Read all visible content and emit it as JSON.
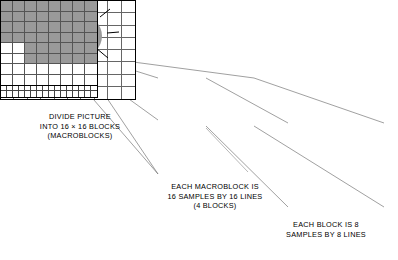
{
  "diagram": {
    "colors": {
      "shaded": "#9a9a9a",
      "black": "#000000",
      "white": "#ffffff",
      "grid_line": "#555555",
      "outline": "#000000"
    },
    "panels": {
      "picture": {
        "name": "picture",
        "grid_cols": 10,
        "grid_rows": 8,
        "sun_label": "sun",
        "selected_block_label": "macroblock"
      },
      "macroblock": {
        "name": "macroblock",
        "grid_cols": 16,
        "grid_rows": 16,
        "highlight_block_label": "block",
        "shaded_cells": [
          [
            0,
            0
          ],
          [
            0,
            1
          ],
          [
            0,
            2
          ],
          [
            0,
            3
          ],
          [
            0,
            4
          ],
          [
            0,
            5
          ],
          [
            0,
            6
          ],
          [
            0,
            7
          ],
          [
            0,
            8
          ],
          [
            0,
            9
          ],
          [
            0,
            10
          ],
          [
            0,
            11
          ],
          [
            0,
            12
          ],
          [
            0,
            13
          ],
          [
            0,
            14
          ],
          [
            0,
            15
          ],
          [
            1,
            0
          ],
          [
            1,
            1
          ],
          [
            1,
            2
          ],
          [
            1,
            3
          ],
          [
            1,
            4
          ],
          [
            1,
            5
          ],
          [
            1,
            6
          ],
          [
            1,
            7
          ],
          [
            1,
            8
          ],
          [
            1,
            9
          ],
          [
            1,
            10
          ],
          [
            1,
            11
          ],
          [
            1,
            12
          ],
          [
            1,
            13
          ],
          [
            1,
            14
          ],
          [
            1,
            15
          ],
          [
            2,
            0
          ],
          [
            2,
            1
          ],
          [
            2,
            2
          ],
          [
            2,
            3
          ],
          [
            2,
            4
          ],
          [
            2,
            5
          ],
          [
            2,
            6
          ],
          [
            2,
            7
          ],
          [
            2,
            8
          ],
          [
            2,
            9
          ],
          [
            2,
            10
          ],
          [
            2,
            11
          ],
          [
            2,
            12
          ],
          [
            2,
            13
          ],
          [
            2,
            14
          ],
          [
            2,
            15
          ],
          [
            3,
            5
          ],
          [
            3,
            6
          ],
          [
            3,
            7
          ],
          [
            3,
            8
          ],
          [
            3,
            9
          ],
          [
            3,
            10
          ],
          [
            3,
            11
          ],
          [
            3,
            12
          ],
          [
            3,
            13
          ],
          [
            3,
            14
          ],
          [
            3,
            15
          ],
          [
            4,
            5
          ],
          [
            4,
            6
          ],
          [
            4,
            7
          ],
          [
            4,
            8
          ],
          [
            4,
            9
          ],
          [
            4,
            10
          ],
          [
            4,
            11
          ],
          [
            4,
            12
          ],
          [
            4,
            13
          ],
          [
            4,
            14
          ],
          [
            4,
            15
          ],
          [
            5,
            8
          ],
          [
            5,
            9
          ],
          [
            5,
            10
          ],
          [
            5,
            11
          ],
          [
            5,
            12
          ],
          [
            5,
            13
          ],
          [
            5,
            14
          ],
          [
            5,
            15
          ],
          [
            6,
            8
          ],
          [
            6,
            9
          ],
          [
            6,
            10
          ],
          [
            6,
            11
          ],
          [
            6,
            12
          ],
          [
            6,
            13
          ],
          [
            6,
            14
          ],
          [
            6,
            15
          ],
          [
            7,
            8
          ],
          [
            7,
            9
          ],
          [
            7,
            10
          ],
          [
            7,
            11
          ],
          [
            7,
            12
          ],
          [
            7,
            13
          ],
          [
            7,
            14
          ],
          [
            7,
            15
          ]
        ],
        "black_cells": [
          [
            12,
            8
          ],
          [
            13,
            6
          ]
        ]
      },
      "block": {
        "name": "block",
        "grid_cols": 8,
        "grid_rows": 8,
        "shaded_cells": [
          [
            0,
            0
          ],
          [
            0,
            1
          ],
          [
            0,
            2
          ],
          [
            0,
            3
          ],
          [
            0,
            4
          ],
          [
            0,
            5
          ],
          [
            0,
            6
          ],
          [
            0,
            7
          ],
          [
            1,
            0
          ],
          [
            1,
            1
          ],
          [
            1,
            2
          ],
          [
            1,
            3
          ],
          [
            1,
            4
          ],
          [
            1,
            5
          ],
          [
            1,
            6
          ],
          [
            1,
            7
          ],
          [
            2,
            0
          ],
          [
            2,
            1
          ],
          [
            2,
            2
          ],
          [
            2,
            3
          ],
          [
            2,
            4
          ],
          [
            2,
            5
          ],
          [
            2,
            6
          ],
          [
            2,
            7
          ],
          [
            3,
            0
          ],
          [
            3,
            1
          ],
          [
            3,
            2
          ],
          [
            3,
            3
          ],
          [
            3,
            4
          ],
          [
            3,
            5
          ],
          [
            3,
            6
          ],
          [
            3,
            7
          ],
          [
            4,
            2
          ],
          [
            4,
            3
          ],
          [
            4,
            4
          ],
          [
            4,
            5
          ],
          [
            4,
            6
          ],
          [
            4,
            7
          ],
          [
            5,
            2
          ],
          [
            5,
            3
          ],
          [
            5,
            4
          ],
          [
            5,
            5
          ],
          [
            5,
            6
          ],
          [
            5,
            7
          ]
        ],
        "black_cells": []
      }
    },
    "captions": {
      "picture": "DIVIDE PICTURE\nINTO 16 × 16 BLOCKS\n(MACROBLOCKS)",
      "macroblock": "EACH MACROBLOCK IS\n16 SAMPLES BY 16 LINES\n(4 BLOCKS)",
      "block": "EACH BLOCK IS 8\nSAMPLES BY 8 LINES"
    }
  }
}
